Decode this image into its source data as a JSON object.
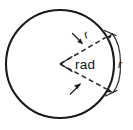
{
  "figure": {
    "type": "geometry-diagram",
    "shape": "circle",
    "background_color": "#ffffff",
    "stroke_color": "#1a1a1a",
    "dashed_stroke_color": "#2b2b2b",
    "labels": {
      "angle": "rad",
      "radius_upper": "r",
      "arc_length": "r"
    },
    "geometry": {
      "circle_center_x": 60,
      "circle_center_y": 64,
      "circle_radius": 54,
      "upper_radius_endpoint_x": 105,
      "upper_radius_endpoint_y": 38,
      "lower_radius_endpoint_x": 106,
      "lower_radius_endpoint_y": 89,
      "arc_dimension_top_x": 112,
      "arc_dimension_top_y": 33,
      "arc_dimension_bottom_x": 113,
      "arc_dimension_bottom_y": 93
    }
  }
}
